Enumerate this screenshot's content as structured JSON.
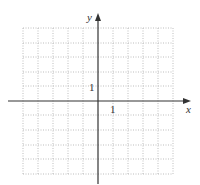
{
  "graph": {
    "type": "coordinate-grid",
    "x_axis_label": "x",
    "y_axis_label": "y",
    "x_tick_label": "1",
    "y_tick_label": "1",
    "grid": {
      "columns": 10,
      "rows": 10,
      "x_range": [
        -5,
        5
      ],
      "y_range": [
        -5,
        5
      ],
      "style": "dotted",
      "color": "#bbbbbb"
    },
    "axis_color": "#333333",
    "background": "#ffffff"
  }
}
